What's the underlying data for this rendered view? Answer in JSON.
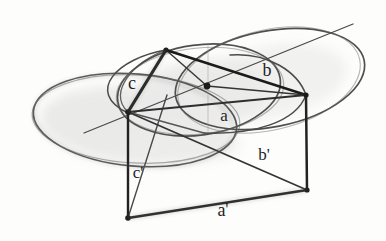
{
  "figure": {
    "type": "hand-drawn descriptive geometry sketch",
    "colors": {
      "paper": "#fdfdfc",
      "ink_dark": "#1b1b1b",
      "ink_medium": "#333333",
      "ink_light": "#4a4a4a",
      "pencil_shade": "#9a9a9a"
    },
    "labels": {
      "side_c": "c",
      "side_b": "b",
      "side_a": "a",
      "side_c_prime": "c'",
      "side_b_prime": "b'",
      "side_a_prime": "a'"
    }
  }
}
